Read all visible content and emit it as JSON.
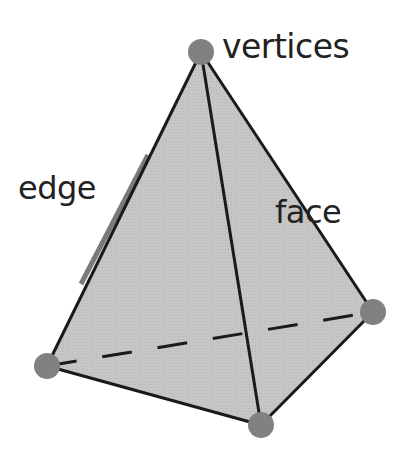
{
  "labels": {
    "vertices": "vertices",
    "edge": "edge",
    "face": "face"
  },
  "colors": {
    "face_fill": "#c4c4c4",
    "face_fill_dark": "#bbbbbb",
    "edge_stroke": "#1a1a1a",
    "vertex_fill": "#818181",
    "edge_highlight": "#7a7a7a"
  },
  "vertices": [
    {
      "name": "top",
      "x": 201,
      "y": 52
    },
    {
      "name": "left",
      "x": 47,
      "y": 366
    },
    {
      "name": "bottom",
      "x": 261,
      "y": 425
    },
    {
      "name": "right",
      "x": 373,
      "y": 312
    }
  ]
}
